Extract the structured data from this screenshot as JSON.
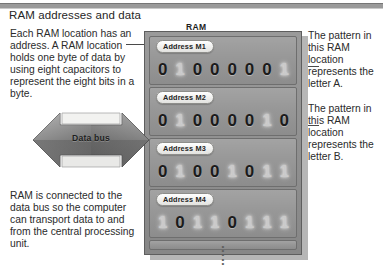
{
  "page_title": "RAM addresses and data",
  "diagram_label": "RAM",
  "annotations": {
    "top_left": "Each RAM location has an address. A RAM location holds one byte of data by using eight capacitors to represent the eight bits in a byte.",
    "bottom_left": "RAM is connected to the data bus so the computer can transport data to and from the central processing unit.",
    "right_top": "The pattern in this RAM location represents the letter A.",
    "right_bottom": "The pattern in this RAM location represents the letter B."
  },
  "data_bus": {
    "label": "Data bus"
  },
  "ram": {
    "rows": [
      {
        "address": "Address M1",
        "bits": [
          "0",
          "1",
          "0",
          "0",
          "0",
          "0",
          "0",
          "1"
        ],
        "states": [
          "on",
          "off",
          "on",
          "on",
          "on",
          "on",
          "on",
          "off"
        ]
      },
      {
        "address": "Address M2",
        "bits": [
          "0",
          "1",
          "0",
          "0",
          "0",
          "0",
          "1",
          "0"
        ],
        "states": [
          "on",
          "off",
          "on",
          "on",
          "on",
          "on",
          "off",
          "on"
        ]
      },
      {
        "address": "Address M3",
        "bits": [
          "0",
          "1",
          "0",
          "0",
          "1",
          "0",
          "1",
          "1"
        ],
        "states": [
          "on",
          "off",
          "on",
          "on",
          "off",
          "on",
          "off",
          "off"
        ]
      },
      {
        "address": "Address M4",
        "bits": [
          "1",
          "0",
          "1",
          "1",
          "0",
          "1",
          "1",
          "1"
        ],
        "states": [
          "off",
          "on",
          "off",
          "off",
          "on",
          "off",
          "off",
          "off"
        ]
      }
    ],
    "continuation_indicator": "vertical-ellipsis"
  },
  "colors": {
    "module_body": "#8f8f8f",
    "row_body": "#949494",
    "bit_on": "#1b1b1b",
    "bit_off": "#cfcfcf",
    "rule": "#9a9a9a",
    "text": "#2b2b2b"
  }
}
